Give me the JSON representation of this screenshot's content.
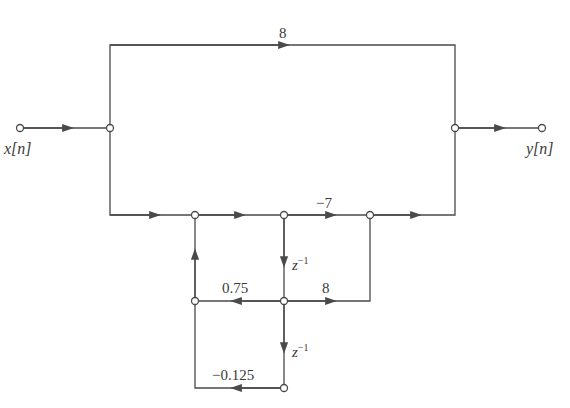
{
  "diagram": {
    "type": "signal-flow-graph",
    "colors": {
      "line": "#4a4a4a",
      "text": "#3a3a3a",
      "background": "#ffffff"
    },
    "input_label": "x[n]",
    "output_label": "y[n]",
    "delay_label_base": "z",
    "delay_label_exp": "−1",
    "gains": {
      "top_feedforward": "8",
      "b1": "−7",
      "b2": "8",
      "a1": "0.75",
      "a2": "−0.125"
    }
  }
}
